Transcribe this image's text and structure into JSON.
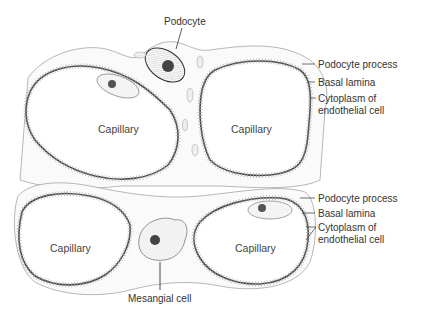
{
  "diagram": {
    "type": "anatomical-illustration",
    "labels": {
      "podocyte": "Podocyte",
      "mesangial_cell": "Mesangial cell",
      "top_group": {
        "podocyte_process": "Podocyte process",
        "basal_lamina": "Basal lamina",
        "cytoplasm_line1": "Cytoplasm of",
        "cytoplasm_line2": "endothelial cell"
      },
      "bottom_group": {
        "podocyte_process": "Podocyte process",
        "basal_lamina": "Basal lamina",
        "cytoplasm_line1": "Cytoplasm of",
        "cytoplasm_line2": "endothelial cell"
      },
      "capillaries": [
        "Capillary",
        "Capillary",
        "Capillary",
        "Capillary"
      ]
    },
    "colors": {
      "line": "#3a3a3a",
      "fill": "#ffffff",
      "cytoplasm": "#f4f4f4",
      "nucleus": "#555555",
      "text": "#333333"
    }
  }
}
